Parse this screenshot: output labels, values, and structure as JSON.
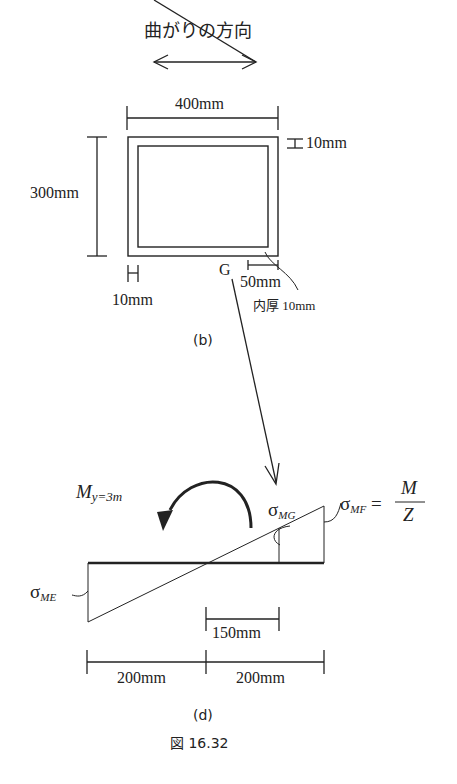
{
  "figure_b": {
    "direction_label": "曲がりの方向",
    "width_label": "400mm",
    "height_label": "300mm",
    "top_thickness_label": "10mm",
    "left_thickness_label": "10mm",
    "point_g_label": "G",
    "offset_label": "50mm",
    "inner_thickness_label": "内厚 10mm",
    "caption": "(b)"
  },
  "figure_d": {
    "moment_symbol": "M",
    "moment_subscript": "y=3m",
    "sigma_mg_symbol": "σ",
    "sigma_mg_subscript": "MG",
    "sigma_mf_symbol": "σ",
    "sigma_mf_subscript": "MF",
    "equals": "=",
    "fraction_numerator": "M",
    "fraction_denominator": "Z",
    "sigma_me_symbol": "σ",
    "sigma_me_subscript": "ME",
    "dim_150_label": "150mm",
    "dim_left_label": "200mm",
    "dim_right_label": "200mm",
    "caption": "(d)"
  },
  "figure_caption": "図 16.32"
}
